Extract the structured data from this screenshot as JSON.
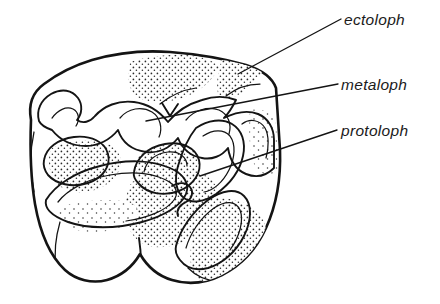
{
  "figure": {
    "kind": "scientific-line-drawing",
    "background_color": "#ffffff",
    "ink_color": "#141414",
    "width": 440,
    "height": 304
  },
  "labels": [
    {
      "id": "ectoloph",
      "text": "ectoloph",
      "text_x": 344,
      "text_y": 25,
      "leader": "M341,19 L238,74",
      "target_structure": "outer crest band along buccal margin"
    },
    {
      "id": "metaloph",
      "text": "metaloph",
      "text_y": 90,
      "text_x": 341,
      "leader": "M338,84 L146,121",
      "target_structure": "posterior transverse crest"
    },
    {
      "id": "protoloph",
      "text": "protoloph",
      "text_x": 341,
      "text_y": 136,
      "leader": "M337,130 L200,176",
      "target_structure": "anterior transverse crest"
    }
  ],
  "textures": {
    "hatch_label": "diagonal-hatch",
    "hatch_angle_deg": 45,
    "hatch_spacing_px": 5,
    "stipple_label": "stipple-dots",
    "stipple_dot_radius_px": 0.85
  },
  "anatomy_regions": [
    {
      "name": "crown-outline",
      "style": "white"
    },
    {
      "name": "ectoloph-band",
      "style": "hatched"
    },
    {
      "name": "metaloph-band",
      "style": "hatched"
    },
    {
      "name": "protoloph-band",
      "style": "hatched"
    },
    {
      "name": "anterior-valley",
      "style": "stippled"
    },
    {
      "name": "median-valley",
      "style": "stippled"
    },
    {
      "name": "posterior-valley",
      "style": "stippled"
    },
    {
      "name": "lingual-cusp-lobe",
      "style": "stippled"
    },
    {
      "name": "crown-base-lobes",
      "style": "white"
    }
  ]
}
